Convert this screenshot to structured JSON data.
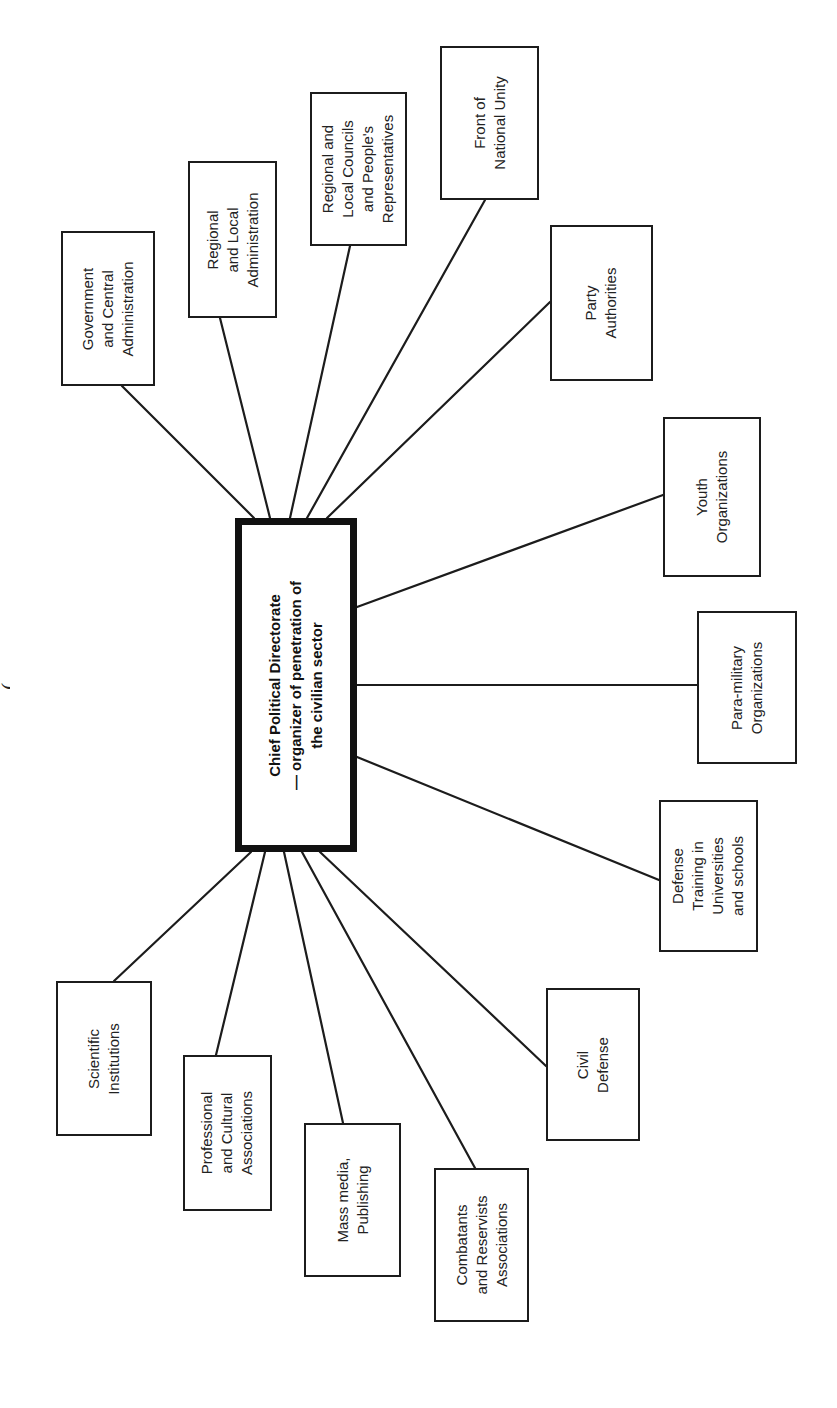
{
  "diagram": {
    "type": "radial-organization-chart",
    "edge_title": "(",
    "center": {
      "label": "Chief Political Directorate\n— organizer of penetration of\nthe civilian sector",
      "box": [
        235,
        518,
        357,
        852
      ]
    },
    "nodes": [
      {
        "id": "government-central-administration",
        "label": "Government\nand Central\nAdministration",
        "box": [
          61,
          231,
          155,
          386
        ],
        "link": [
          122,
          386,
          254,
          518
        ]
      },
      {
        "id": "regional-local-administration",
        "label": "Regional\nand Local\nAdministration",
        "box": [
          188,
          161,
          277,
          318
        ],
        "link": [
          220,
          318,
          270,
          518
        ]
      },
      {
        "id": "regional-local-councils",
        "label": "Regional and\nLocal Councils\nand People's\nRepresentatives",
        "box": [
          310,
          92,
          407,
          246
        ],
        "link": [
          350,
          246,
          290,
          518
        ]
      },
      {
        "id": "front-of-national-unity",
        "label": "Front of\nNational Unity",
        "box": [
          440,
          46,
          539,
          200
        ],
        "link": [
          485,
          200,
          307,
          518
        ]
      },
      {
        "id": "party-authorities",
        "label": "Party\nAuthorities",
        "box": [
          550,
          225,
          653,
          381
        ],
        "link": [
          550,
          302,
          327,
          518
        ]
      },
      {
        "id": "youth-organizations",
        "label": "Youth\nOrganizations",
        "box": [
          663,
          417,
          761,
          577
        ],
        "link": [
          663,
          495,
          357,
          607
        ]
      },
      {
        "id": "para-military-organizations",
        "label": "Para-military\nOrganizations",
        "box": [
          697,
          611,
          797,
          764
        ],
        "link": [
          697,
          685,
          357,
          685
        ]
      },
      {
        "id": "defense-training",
        "label": "Defense\nTraining in\nUniversities\nand schools",
        "box": [
          659,
          800,
          758,
          952
        ],
        "link": [
          659,
          880,
          357,
          757
        ]
      },
      {
        "id": "civil-defense",
        "label": "Civil\nDefense",
        "box": [
          546,
          988,
          640,
          1141
        ],
        "link": [
          546,
          1066,
          320,
          852
        ]
      },
      {
        "id": "combatants-reservists",
        "label": "Combatants\nand Reservists\nAssociations",
        "box": [
          434,
          1168,
          529,
          1322
        ],
        "link": [
          475,
          1168,
          302,
          852
        ]
      },
      {
        "id": "mass-media-publishing",
        "label": "Mass media,\nPublishing",
        "box": [
          304,
          1123,
          401,
          1277
        ],
        "link": [
          343,
          1123,
          284,
          852
        ]
      },
      {
        "id": "professional-cultural",
        "label": "Professional\nand Cultural\nAssociations",
        "box": [
          183,
          1055,
          272,
          1211
        ],
        "link": [
          216,
          1055,
          265,
          852
        ]
      },
      {
        "id": "scientific-institutions",
        "label": "Scientific\nInstitutions",
        "box": [
          56,
          981,
          152,
          1136
        ],
        "link": [
          114,
          981,
          251,
          852
        ]
      }
    ]
  }
}
